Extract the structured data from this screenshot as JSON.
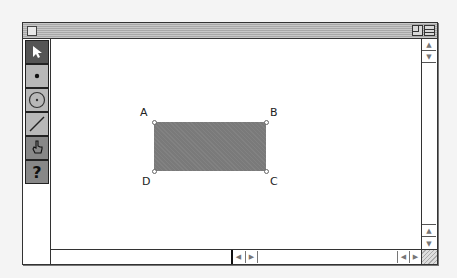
{
  "window": {
    "title": "",
    "controls": [
      "close-box",
      "zoom-box",
      "collapse-box"
    ]
  },
  "toolbox": {
    "tools": [
      {
        "name": "arrow-tool",
        "icon": "arrow-pointer-icon",
        "glyph": "➤",
        "selected": true
      },
      {
        "name": "point-tool",
        "icon": "point-icon",
        "glyph": "•",
        "selected": false
      },
      {
        "name": "compass-tool",
        "icon": "circle-icon",
        "glyph": "⊙",
        "selected": false
      },
      {
        "name": "straightedge-tool",
        "icon": "line-segment-icon",
        "glyph": "╱",
        "selected": false
      },
      {
        "name": "text-tool",
        "icon": "hand-icon",
        "glyph": "✋",
        "selected": false
      },
      {
        "name": "info-tool",
        "icon": "question-icon",
        "glyph": "?",
        "selected": false
      }
    ]
  },
  "canvas": {
    "shape": {
      "type": "rectangle",
      "fill": "#7a7a7a",
      "vertices": [
        {
          "label": "A",
          "x": 154,
          "y": 122
        },
        {
          "label": "B",
          "x": 266,
          "y": 122
        },
        {
          "label": "C",
          "x": 266,
          "y": 171
        },
        {
          "label": "D",
          "x": 154,
          "y": 171
        }
      ]
    },
    "labels": {
      "A": "A",
      "B": "B",
      "C": "C",
      "D": "D"
    }
  },
  "scrollbars": {
    "vertical": {
      "up_glyph": "▲",
      "down_glyph": "▼"
    },
    "horizontal": {
      "left_glyph": "◀",
      "right_glyph": "▶"
    }
  }
}
